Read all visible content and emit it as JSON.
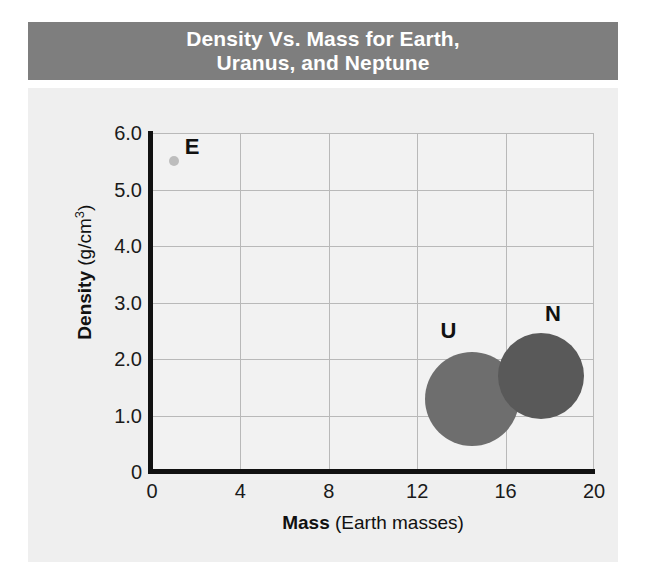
{
  "title": "Density Vs. Mass for Earth,\nUranus, and Neptune",
  "title_line1": "Density Vs. Mass for Earth,",
  "title_line2": "Uranus, and Neptune",
  "colors": {
    "banner_bg": "#7e7e7e",
    "banner_text": "#ffffff",
    "panel_bg": "#efefef",
    "plot_bg": "#f2f2f2",
    "grid": "#b9b9b9",
    "axis": "#111111",
    "earth": "#bdbdbd",
    "uranus": "#6e6e6e",
    "neptune": "#595959"
  },
  "axes": {
    "x_title_bold": "Mass",
    "x_title_rest": " (Earth masses)",
    "y_title_bold": "Density",
    "y_title_rest": " (g/cm",
    "y_title_sup": "3",
    "y_title_close": ")"
  },
  "chart_data": {
    "type": "scatter",
    "title": "Density Vs. Mass for Earth, Uranus, and Neptune",
    "xlabel": "Mass (Earth masses)",
    "ylabel": "Density (g/cm3)",
    "xlim": [
      0,
      20
    ],
    "ylim": [
      0,
      6.0
    ],
    "xticks": [
      0,
      4,
      8,
      12,
      16,
      20
    ],
    "xtick_labels": [
      "0",
      "4",
      "8",
      "12",
      "16",
      "20"
    ],
    "yticks": [
      0,
      1.0,
      2.0,
      3.0,
      4.0,
      5.0,
      6.0
    ],
    "ytick_labels": [
      "0",
      "1.0",
      "2.0",
      "3.0",
      "4.0",
      "5.0",
      "6.0"
    ],
    "grid": true,
    "legend": "none",
    "points": [
      {
        "label": "E",
        "name": "Earth",
        "x": 1.0,
        "y": 5.5,
        "marker_radius_px": 5,
        "color": "#bdbdbd",
        "label_offset_x_px": 18,
        "label_offset_y_px": -14
      },
      {
        "label": "U",
        "name": "Uranus",
        "x": 14.5,
        "y": 1.3,
        "marker_radius_px": 47,
        "color": "#6e6e6e",
        "label_offset_x_px": -24,
        "label_offset_y_px": -68
      },
      {
        "label": "N",
        "name": "Neptune",
        "x": 17.6,
        "y": 1.7,
        "marker_radius_px": 43,
        "color": "#595959",
        "label_offset_x_px": 12,
        "label_offset_y_px": -62
      }
    ]
  }
}
